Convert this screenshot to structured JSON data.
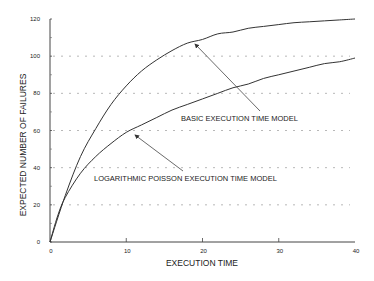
{
  "chart_data": {
    "type": "line",
    "title": "",
    "xlabel": "EXECUTION TIME",
    "ylabel": "EXPECTED NUMBER OF FAILURES",
    "xlim": [
      0,
      40
    ],
    "ylim": [
      0,
      120
    ],
    "xticks": [
      0,
      10,
      20,
      30,
      40
    ],
    "yticks": [
      0,
      20,
      40,
      60,
      80,
      100,
      120
    ],
    "grid": {
      "y": true,
      "x": false,
      "style": "dashed",
      "lines": [
        20,
        40,
        60,
        80,
        100
      ]
    },
    "legend": "none (annotated with arrows)",
    "series": [
      {
        "name": "BASIC EXECUTION TIME MODEL",
        "x": [
          0,
          2,
          4,
          6,
          8,
          10,
          12,
          14,
          16,
          18,
          20,
          22,
          24,
          26,
          28,
          30,
          32,
          34,
          36,
          38,
          40
        ],
        "values": [
          0,
          25,
          46,
          61,
          74,
          84,
          92,
          98,
          103,
          107,
          109,
          112,
          113,
          115,
          116,
          117,
          118,
          118.5,
          119,
          119.5,
          120
        ]
      },
      {
        "name": "LOGARITHMIC POISSON EXECUTION TIME MODEL",
        "x": [
          0,
          1,
          2,
          4,
          6,
          8,
          10,
          12,
          14,
          16,
          18,
          20,
          22,
          24,
          26,
          28,
          30,
          32,
          34,
          36,
          38,
          40
        ],
        "values": [
          0,
          14,
          24,
          37,
          46,
          53,
          59,
          63,
          67,
          71,
          74,
          77,
          80,
          83,
          85,
          88,
          90,
          92,
          94,
          96,
          97,
          99
        ]
      }
    ],
    "annotations": [
      {
        "text": "BASIC EXECUTION TIME MODEL",
        "arrow_to": [
          18.6,
          106
        ]
      },
      {
        "text": "LOGARITHMIC POISSON EXECUTION TIME MODEL",
        "arrow_to": [
          10.9,
          58
        ]
      }
    ]
  }
}
